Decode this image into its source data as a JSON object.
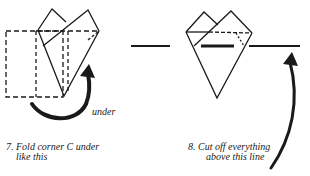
{
  "figures": [
    {
      "step": "7.",
      "caption_line1": "Fold corner C under",
      "caption_line2": "like this",
      "arrow_label": "under"
    },
    {
      "step": "8.",
      "caption_line1": "Cut off everything",
      "caption_line2": "above this line"
    }
  ],
  "colors": {
    "ink": "#1a1a1a",
    "paper": "#ffffff"
  }
}
